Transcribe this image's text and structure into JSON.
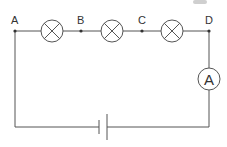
{
  "diagram": {
    "type": "series circuit",
    "points": [
      {
        "label": "A",
        "x": 15,
        "y": 31
      },
      {
        "label": "B",
        "x": 81,
        "y": 31
      },
      {
        "label": "C",
        "x": 142,
        "y": 31
      },
      {
        "label": "D",
        "x": 209,
        "y": 31
      }
    ],
    "lamps": [
      {
        "name": "lamp-1",
        "cx": 52,
        "cy": 31,
        "r": 11
      },
      {
        "name": "lamp-2",
        "cx": 112,
        "cy": 31,
        "r": 11
      },
      {
        "name": "lamp-3",
        "cx": 172,
        "cy": 31,
        "r": 11
      }
    ],
    "ammeter": {
      "label": "A",
      "cx": 209,
      "cy": 79,
      "r": 11
    },
    "battery": {
      "x_short": 99,
      "x_long": 107,
      "y": 127
    },
    "colors": {
      "wire": "#555555",
      "text": "#333333",
      "background": "#ffffff"
    }
  }
}
